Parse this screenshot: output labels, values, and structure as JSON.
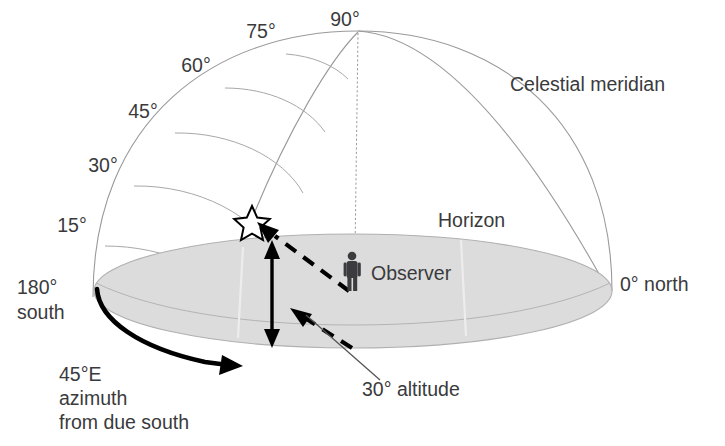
{
  "diagram": {
    "altitude_labels": [
      {
        "id": "alt-15",
        "text": "15°",
        "x": 72,
        "y": 232
      },
      {
        "id": "alt-30",
        "text": "30°",
        "x": 103,
        "y": 172
      },
      {
        "id": "alt-45",
        "text": "45°",
        "x": 143,
        "y": 118
      },
      {
        "id": "alt-60",
        "text": "60°",
        "x": 196,
        "y": 72
      },
      {
        "id": "alt-75",
        "text": "75°",
        "x": 261,
        "y": 38
      },
      {
        "id": "alt-90",
        "text": "90°",
        "x": 345,
        "y": 26
      }
    ],
    "labels": {
      "celestial_meridian": "Celestial meridian",
      "horizon": "Horizon",
      "observer": "Observer",
      "north": "0° north",
      "south_deg": "180°",
      "south_word": "south",
      "altitude_callout": "30° altitude",
      "azimuth_line1": "45°E",
      "azimuth_line2": "azimuth",
      "azimuth_line3": "from due south"
    },
    "icons": {
      "star": "star-icon",
      "observer_figure": "person-icon"
    },
    "values": {
      "star_altitude": "30°",
      "star_azimuth": "45°E",
      "zenith_altitude": "90°",
      "north_azimuth": "0°",
      "south_azimuth": "180°"
    },
    "colors": {
      "ground": "#dcdcdc",
      "outline": "#9a9a9c",
      "ink": "#000000",
      "text": "#3a3a3c"
    }
  }
}
